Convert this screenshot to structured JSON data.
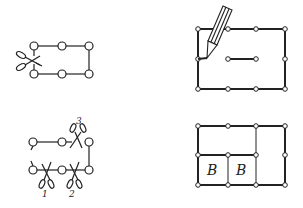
{
  "figure": {
    "panels": [
      {
        "id": "cut-loop",
        "description": "rectangular chain of six nodes with scissors cutting the left edge"
      },
      {
        "id": "draw-rectangle",
        "description": "pencil drawing a rectangle of ten nodes with an inner segment"
      },
      {
        "id": "multi-cut",
        "description": "chain of nodes cut at three numbered places"
      },
      {
        "id": "grid-blocks",
        "description": "rectangular grid with two labeled blocks"
      }
    ],
    "cut_labels": [
      "1",
      "2",
      "3"
    ],
    "block_labels": [
      "B",
      "B"
    ],
    "colors": {
      "stroke": "#222222",
      "background": "#ffffff"
    }
  }
}
